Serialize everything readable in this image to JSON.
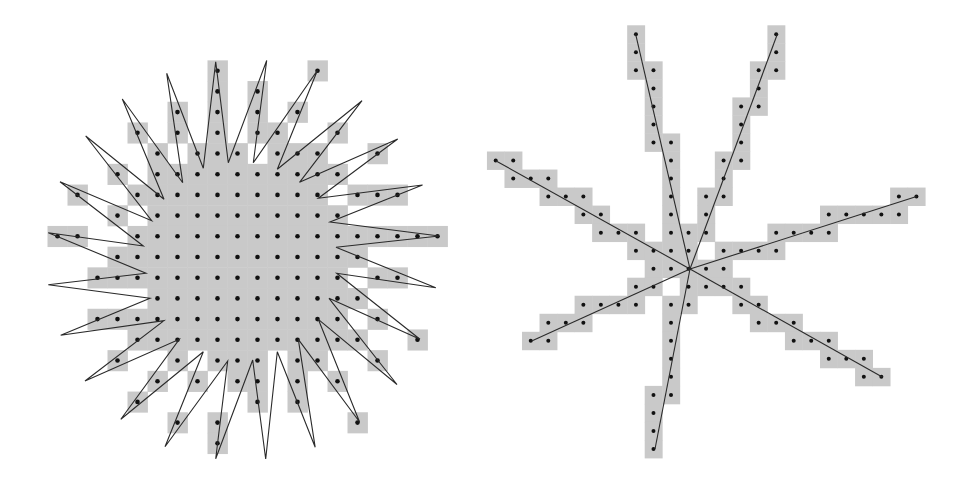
{
  "figures": [
    {
      "id": "left-star-polygon",
      "description": "Star-shaped polygon rasterized on pixel grid; filled pixels shown gray with sample-point dots",
      "colors": {
        "cell": "#c9c9c9",
        "dot": "#111111",
        "line": "#2a2a2a"
      },
      "grid": {
        "x0": 57.5,
        "y0": 70.7,
        "dx": 20,
        "dy": 20.7,
        "dot_radius": 2.3
      },
      "filled_cells_by_row": [
        [
          8,
          13
        ],
        [
          8,
          10
        ],
        [
          6,
          8,
          10,
          12
        ],
        [
          4,
          6,
          8,
          10,
          11,
          14
        ],
        [
          5,
          7,
          8,
          9,
          11,
          12,
          13,
          16
        ],
        [
          3,
          5,
          6,
          7,
          8,
          9,
          10,
          11,
          12,
          13,
          14
        ],
        [
          1,
          4,
          5,
          6,
          7,
          8,
          9,
          10,
          11,
          12,
          13,
          15,
          16,
          17
        ],
        [
          3,
          5,
          6,
          7,
          8,
          9,
          10,
          11,
          12,
          13,
          14
        ],
        [
          0,
          1,
          4,
          5,
          6,
          7,
          8,
          9,
          10,
          11,
          12,
          13,
          14,
          15,
          16,
          17,
          18,
          19
        ],
        [
          3,
          4,
          5,
          6,
          7,
          8,
          9,
          10,
          11,
          12,
          13,
          14,
          15
        ],
        [
          2,
          3,
          4,
          5,
          6,
          7,
          8,
          9,
          10,
          11,
          12,
          13,
          14,
          16,
          17
        ],
        [
          5,
          6,
          7,
          8,
          9,
          10,
          11,
          12,
          13,
          14,
          15
        ],
        [
          2,
          3,
          4,
          5,
          6,
          7,
          8,
          9,
          10,
          11,
          12,
          13,
          14,
          16
        ],
        [
          4,
          5,
          6,
          7,
          8,
          9,
          10,
          11,
          12,
          13,
          14,
          15,
          18
        ],
        [
          3,
          6,
          8,
          9,
          10,
          12,
          13,
          16
        ],
        [
          5,
          7,
          9,
          10,
          12,
          14
        ],
        [
          4,
          10,
          12
        ],
        [
          6,
          8,
          15
        ],
        [
          8
        ]
      ],
      "polygon": [
        [
          215.7,
          61.7
        ],
        [
          228.3,
          162.7
        ],
        [
          266.7,
          60.5
        ],
        [
          253.3,
          162.7
        ],
        [
          317.5,
          70.3
        ],
        [
          277.3,
          169.3
        ],
        [
          362.0,
          100.7
        ],
        [
          299.5,
          182.3
        ],
        [
          397.7,
          139.0
        ],
        [
          318.3,
          198.3
        ],
        [
          422.5,
          185.0
        ],
        [
          330.0,
          222.0
        ],
        [
          439.2,
          236.0
        ],
        [
          336.0,
          247.3
        ],
        [
          435.8,
          287.7
        ],
        [
          336.7,
          273.3
        ],
        [
          420.0,
          339.3
        ],
        [
          329.0,
          298.3
        ],
        [
          397.0,
          384.5
        ],
        [
          318.3,
          319.3
        ],
        [
          359.6,
          422.0
        ],
        [
          298.3,
          339.3
        ],
        [
          315.2,
          447.3
        ],
        [
          277.3,
          351.7
        ],
        [
          265.7,
          459.0
        ],
        [
          252.7,
          360.0
        ],
        [
          215.7,
          458.7
        ],
        [
          227.7,
          361.0
        ],
        [
          165.0,
          446.7
        ],
        [
          203.3,
          351.7
        ],
        [
          120.8,
          419.2
        ],
        [
          179.3,
          339.3
        ],
        [
          85.0,
          381.0
        ],
        [
          164.0,
          320.7
        ],
        [
          60.7,
          335.2
        ],
        [
          150.0,
          298.3
        ],
        [
          48.3,
          284.8
        ],
        [
          146.0,
          273.3
        ],
        [
          48.3,
          232.7
        ],
        [
          143.3,
          246.0
        ],
        [
          60.0,
          181.7
        ],
        [
          151.7,
          220.7
        ],
        [
          85.7,
          136.0
        ],
        [
          164.0,
          199.3
        ],
        [
          122.3,
          99.0
        ],
        [
          182.7,
          182.7
        ],
        [
          166.7,
          73.3
        ],
        [
          203.3,
          168.3
        ]
      ]
    },
    {
      "id": "right-ray-star",
      "description": "Seven line segments radiating from a common center, rasterized on pixel grid; touched pixels shown gray with sample-point dots",
      "colors": {
        "cell": "#c9c9c9",
        "dot": "#111111",
        "line": "#2a2a2a"
      },
      "grid": {
        "x0": 495.7,
        "y0": 34.3,
        "dx": 17.53,
        "dy": 18.03,
        "dot_radius": 2.0
      },
      "filled_cells_by_row": [
        [
          8,
          16
        ],
        [
          8,
          16
        ],
        [
          8,
          9,
          15,
          16
        ],
        [
          9,
          15
        ],
        [
          9,
          14,
          15
        ],
        [
          9,
          14
        ],
        [
          9,
          10,
          14
        ],
        [
          0,
          1,
          10,
          13,
          14
        ],
        [
          1,
          2,
          3,
          10,
          13
        ],
        [
          3,
          4,
          5,
          10,
          12,
          13,
          23,
          24
        ],
        [
          5,
          6,
          10,
          12,
          19,
          20,
          21,
          22,
          23
        ],
        [
          6,
          7,
          8,
          10,
          11,
          12,
          16,
          17,
          18,
          19
        ],
        [
          8,
          9,
          10,
          11,
          13,
          14,
          15,
          16
        ],
        [
          9,
          10,
          11,
          12,
          13
        ],
        [
          8,
          9,
          11,
          12,
          13,
          14
        ],
        [
          5,
          6,
          7,
          8,
          10,
          11,
          14,
          15
        ],
        [
          3,
          4,
          5,
          10,
          15,
          16,
          17
        ],
        [
          2,
          3,
          10,
          17,
          18,
          19
        ],
        [
          10,
          19,
          20,
          21
        ],
        [
          10,
          21,
          22
        ],
        [
          9,
          10
        ],
        [
          9
        ],
        [
          9
        ],
        [
          9
        ]
      ],
      "center": [
        690.0,
        269.0
      ],
      "ray_endpoints": [
        [
          635.7,
          34.3
        ],
        [
          777.3,
          34.3
        ],
        [
          495.7,
          160.7
        ],
        [
          916.5,
          196.5
        ],
        [
          531.7,
          341.0
        ],
        [
          882.7,
          377.3
        ],
        [
          655.0,
          449.0
        ]
      ]
    }
  ]
}
